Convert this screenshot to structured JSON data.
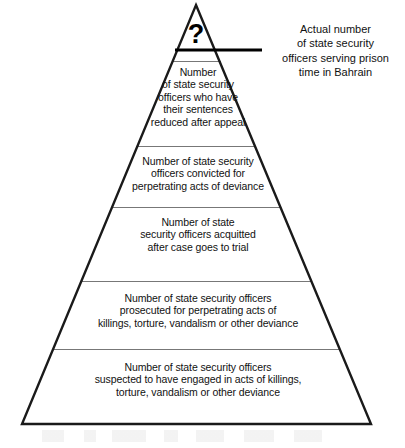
{
  "figure": {
    "type": "pyramid-diagram",
    "apex_symbol": "?",
    "background_color": "#ffffff",
    "outline_color": "#1a1a1a",
    "divider_color": "#777777",
    "text_color": "#111111"
  },
  "callout": {
    "text": "Actual number\nof state security\nofficers serving prison\ntime in Bahrain",
    "leader_line": "horizontal-leader-line"
  },
  "tiers": [
    {
      "index": 1,
      "name": "apex-unknown",
      "text": "?"
    },
    {
      "index": 2,
      "name": "sentences-reduced",
      "text": "Number\nof state security\nofficers who have\ntheir sentences\nreduced after appeal"
    },
    {
      "index": 3,
      "name": "convicted",
      "text": "Number of state security\nofficers convicted for\nperpetrating acts of deviance"
    },
    {
      "index": 4,
      "name": "acquitted",
      "text": "Number of state\nsecurity officers acquitted\nafter case goes to trial"
    },
    {
      "index": 5,
      "name": "prosecuted",
      "text": "Number of state security officers\nprosecuted for perpetrating acts of\nkillings, torture, vandalism or other deviance"
    },
    {
      "index": 6,
      "name": "suspected",
      "text": "Number of state security officers\nsuspected to have engaged in acts of killings,\ntorture, vandalism or other deviance"
    }
  ]
}
